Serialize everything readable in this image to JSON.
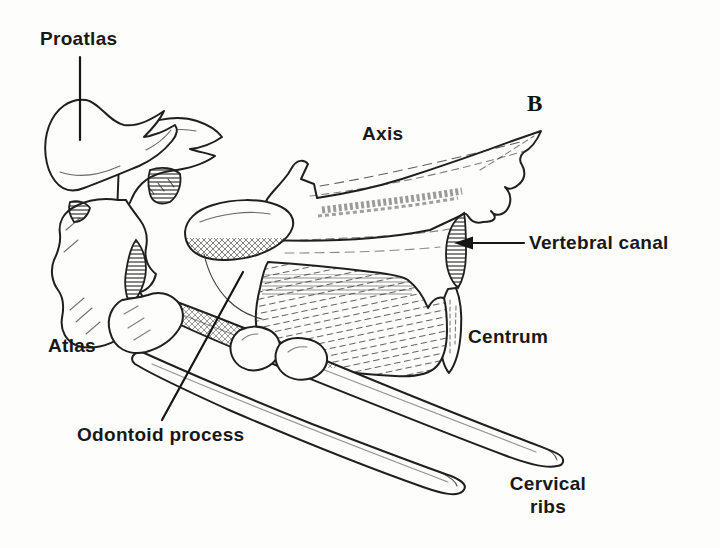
{
  "figure": {
    "type": "anatomical line drawing",
    "panel_letter": "B",
    "labels": {
      "proatlas": "Proatlas",
      "axis": "Axis",
      "vertebral_canal": "Vertebral canal",
      "atlas": "Atlas",
      "centrum": "Centrum",
      "odontoid_process": "Odontoid process",
      "cervical_ribs": [
        "Cervical",
        "ribs"
      ]
    },
    "colors": {
      "ink": "#1f1f1f",
      "paper": "#fdfdfb"
    }
  }
}
